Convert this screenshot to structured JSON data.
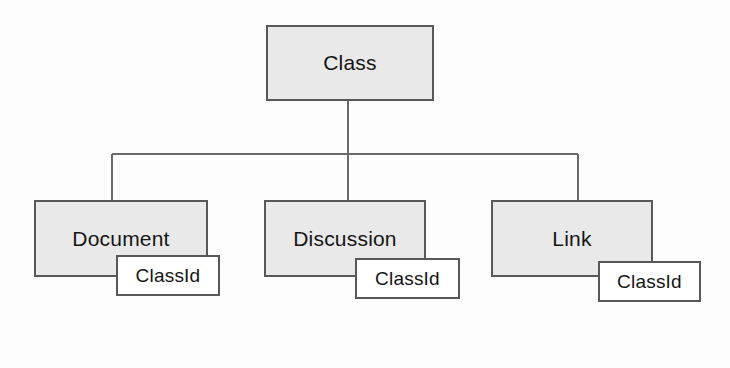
{
  "diagram": {
    "type": "hierarchy-tree",
    "style": {
      "entity_fill": "#e9e9e9",
      "attribute_fill": "#ffffff",
      "border_color": "#585858",
      "line_color": "#6a6a6a",
      "background": "#fdfdfd"
    },
    "root": {
      "id": "class",
      "label": "Class"
    },
    "children": [
      {
        "id": "document",
        "label": "Document",
        "attribute": "ClassId"
      },
      {
        "id": "discussion",
        "label": "Discussion",
        "attribute": "ClassId"
      },
      {
        "id": "link",
        "label": "Link",
        "attribute": "ClassId"
      }
    ],
    "connectors": {
      "trunk_x": 348,
      "bus_y": 154,
      "bus_left_x": 112,
      "bus_right_x": 578,
      "root_bottom_y": 101,
      "child_top_y": 200
    }
  }
}
